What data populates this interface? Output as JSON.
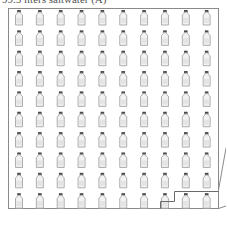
{
  "title": "99.5 liters saltwater (A)",
  "grid": {
    "rows": 10,
    "cols": 10,
    "icon": "bottle-icon"
  },
  "box": {
    "left": 8,
    "top": 8,
    "right": 218,
    "bottom": 208
  },
  "colors": {
    "outline": "#8a8a8a",
    "cap": "#4a4a4a",
    "bottle_fill": "#f2f2f2",
    "bottle_stroke": "#9a9a9a"
  }
}
